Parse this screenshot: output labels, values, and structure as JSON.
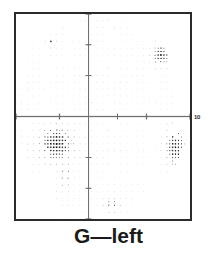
{
  "figure": {
    "caption": "G—left",
    "edge_tick_label": "10",
    "frame_color": "#2b2b2b",
    "background_color": "#ffffff"
  },
  "chart_data": {
    "type": "scatter",
    "title": "G—left",
    "xlabel": "",
    "ylabel": "",
    "xlim": [
      -30,
      30
    ],
    "ylim": [
      -30,
      30
    ],
    "grid": false,
    "legend": null,
    "axes": {
      "horizontal_axis_y": 0,
      "vertical_axis_x": -5,
      "x_ticks": [
        -30,
        -15,
        5,
        15,
        30
      ],
      "y_ticks": [
        30,
        21,
        12,
        -12,
        -21,
        -30
      ]
    },
    "field_boundary": {
      "shape": "oval",
      "center_x": -2,
      "center_y": 1,
      "radius_x": 29,
      "radius_y": 32
    },
    "lattice": {
      "spacing_x": 2.0,
      "spacing_y": 2.0,
      "base_dot_gray": "#d8d8d8",
      "dark_dot_gray": "#3a3a3a"
    },
    "defects": [
      {
        "name": "inferior-nasal-dense-scotoma",
        "x": -16,
        "y": -8,
        "radius_x": 7,
        "radius_y": 6,
        "severity": 1.0,
        "note": "largest, darkest cluster; just below the horizontal axis on the left"
      },
      {
        "name": "inferior-nasal-tail",
        "x": -13,
        "y": -17,
        "radius_x": 3,
        "radius_y": 6,
        "severity": 0.55,
        "note": "faint downward tail extending from the dense scotoma"
      },
      {
        "name": "temporal-edge-scotoma",
        "x": 25,
        "y": -9,
        "radius_x": 4,
        "radius_y": 7,
        "severity": 0.95,
        "note": "elongated dark patch at right field margin below the axis"
      },
      {
        "name": "superior-temporal-patch",
        "x": 20,
        "y": 18,
        "radius_x": 4,
        "radius_y": 4,
        "severity": 0.75,
        "note": "small dark cluster upper right"
      },
      {
        "name": "superior-nasal-spot",
        "x": -18,
        "y": 22,
        "radius_x": 2,
        "radius_y": 2,
        "severity": 0.7,
        "note": "isolated dark spot upper left"
      },
      {
        "name": "inferior-spot",
        "x": 3,
        "y": -26,
        "radius_x": 3,
        "radius_y": 2,
        "severity": 0.7,
        "note": "small dark spot at bottom, right of vertical axis"
      }
    ]
  }
}
